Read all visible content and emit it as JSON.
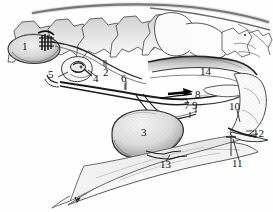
{
  "figure": {
    "width": 273,
    "height": 212,
    "background_color": "#ffffff",
    "ink_color": "#1a1a1a",
    "shade_color": "#b9b9b9",
    "style": "pen-and-ink stipple / hatched anatomical illustration"
  },
  "labels": [
    {
      "id": "1",
      "text": "1",
      "x": 22,
      "y": 46
    },
    {
      "id": "2",
      "text": "2",
      "x": 104,
      "y": 72
    },
    {
      "id": "3",
      "text": "3",
      "x": 143,
      "y": 133
    },
    {
      "id": "4",
      "text": "4",
      "x": 95,
      "y": 78
    },
    {
      "id": "5",
      "text": "5",
      "x": 50,
      "y": 74
    },
    {
      "id": "6",
      "text": "6",
      "x": 122,
      "y": 78
    },
    {
      "id": "7",
      "text": "7",
      "x": 186,
      "y": 105
    },
    {
      "id": "8",
      "text": "8",
      "x": 196,
      "y": 95
    },
    {
      "id": "9",
      "text": "9",
      "x": 194,
      "y": 105
    },
    {
      "id": "10",
      "text": "10",
      "x": 233,
      "y": 107
    },
    {
      "id": "11",
      "text": "11",
      "x": 236,
      "y": 163
    },
    {
      "id": "12",
      "text": "12",
      "x": 255,
      "y": 133
    },
    {
      "id": "13",
      "text": "13",
      "x": 163,
      "y": 164
    },
    {
      "id": "14",
      "text": "14",
      "x": 203,
      "y": 71
    }
  ],
  "structures": [
    {
      "name": "cervical-vertebrae",
      "label_ref": null
    },
    {
      "name": "brain-cerebrum",
      "label_ref": "1"
    },
    {
      "name": "pituitary-region",
      "label_ref": "5"
    },
    {
      "name": "duct-structure",
      "label_ref": "4"
    },
    {
      "name": "upper-canal-2",
      "label_ref": "2"
    },
    {
      "name": "long-duct-6",
      "label_ref": "6"
    },
    {
      "name": "bulbous-gland",
      "label_ref": "3"
    },
    {
      "name": "junction-arrow-8",
      "label_ref": "8"
    },
    {
      "name": "structure-7",
      "label_ref": "7"
    },
    {
      "name": "structure-9",
      "label_ref": "9"
    },
    {
      "name": "pharynx-soft-palate",
      "label_ref": "14"
    },
    {
      "name": "nasal-turbinate-region",
      "label_ref": "10"
    },
    {
      "name": "rostral-tip-11",
      "label_ref": "11"
    },
    {
      "name": "rostral-tip-12",
      "label_ref": "12"
    },
    {
      "name": "tongue-base-13",
      "label_ref": "13"
    }
  ]
}
